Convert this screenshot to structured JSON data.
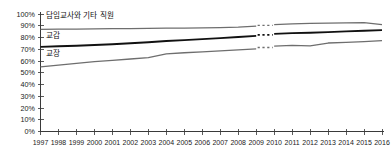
{
  "chart_data": {
    "type": "line",
    "title": "",
    "subtitle": "",
    "xlabel": "",
    "ylabel": "",
    "ylim": [
      0,
      100
    ],
    "xlim": [
      1997,
      2016
    ],
    "grid": false,
    "legend_position": "inline-labels",
    "y_tick_labels": [
      "100%",
      "90%",
      "80%",
      "70%",
      "60%",
      "50%",
      "40%",
      "30%",
      "20%",
      "10%",
      "0%"
    ],
    "y_tick_values": [
      100,
      90,
      80,
      70,
      60,
      50,
      40,
      30,
      20,
      10,
      0
    ],
    "x": [
      1997,
      1998,
      1999,
      2000,
      2001,
      2002,
      2003,
      2004,
      2005,
      2006,
      2007,
      2008,
      2009,
      2010,
      2011,
      2012,
      2013,
      2014,
      2015,
      2016
    ],
    "categories": [
      "1997",
      "1998",
      "1999",
      "2000",
      "2001",
      "2002",
      "2003",
      "2004",
      "2005",
      "2006",
      "2007",
      "2008",
      "2009",
      "2010",
      "2011",
      "2012",
      "2013",
      "2014",
      "2015",
      "2016"
    ],
    "break_after_year": 2009,
    "break_note": "series are interrupted by a dashed break between 2009 and 2010",
    "series": [
      {
        "name": "담임교사와 기타 직원",
        "label": "담임교사와 기타 직원",
        "color": "#6e6e6e",
        "width": 1.3,
        "label_x": 1997.3,
        "label_y": 97,
        "values": [
          87.0,
          87.1,
          87.2,
          87.4,
          87.5,
          87.6,
          87.7,
          87.9,
          88.0,
          88.2,
          88.4,
          88.8,
          89.6,
          90.9,
          91.6,
          92.0,
          92.3,
          92.5,
          92.6,
          91.0
        ]
      },
      {
        "name": "교감",
        "label": "교감",
        "color": "#111111",
        "width": 1.9,
        "label_x": 1997.3,
        "label_y": 80,
        "values": [
          72.0,
          72.5,
          73.0,
          73.6,
          74.3,
          75.1,
          76.0,
          77.0,
          77.8,
          78.6,
          79.5,
          80.4,
          81.4,
          83.1,
          83.7,
          84.1,
          84.6,
          85.2,
          85.8,
          86.3
        ]
      },
      {
        "name": "교장",
        "label": "교장",
        "color": "#6e6e6e",
        "width": 1.3,
        "label_x": 1997.3,
        "label_y": 64,
        "values": [
          55.0,
          56.5,
          58.0,
          59.4,
          60.6,
          61.7,
          62.8,
          66.0,
          67.0,
          67.8,
          68.6,
          69.5,
          70.4,
          72.6,
          73.3,
          72.9,
          75.3,
          75.8,
          76.5,
          77.4
        ]
      }
    ]
  }
}
